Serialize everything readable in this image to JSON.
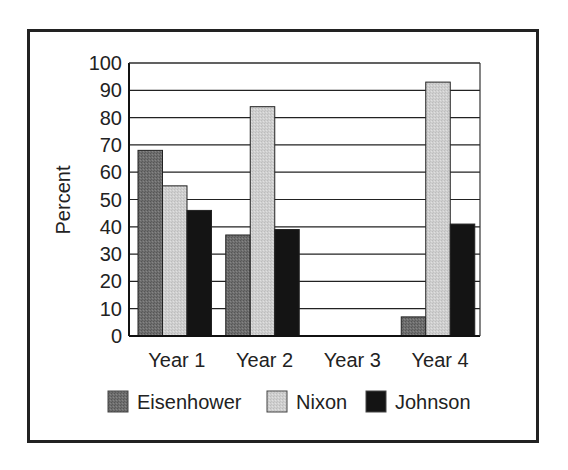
{
  "chart_data": {
    "type": "bar",
    "title": "",
    "xlabel": "",
    "ylabel": "Percent",
    "ylim": [
      0,
      100
    ],
    "yticks": [
      0,
      10,
      20,
      30,
      40,
      50,
      60,
      70,
      80,
      90,
      100
    ],
    "ytick_labels": [
      "0",
      "10",
      "20",
      "30",
      "40",
      "50",
      "60",
      "70",
      "80",
      "90",
      "100"
    ],
    "grid": true,
    "legend_position": "bottom",
    "categories": [
      "Year 1",
      "Year 2",
      "Year 3",
      "Year 4"
    ],
    "series": [
      {
        "name": "Eisenhower",
        "color": "#6e6e6e",
        "values": [
          68,
          37,
          0,
          7
        ]
      },
      {
        "name": "Nixon",
        "color": "#cfcfcf",
        "values": [
          55,
          84,
          0,
          93
        ]
      },
      {
        "name": "Johnson",
        "color": "#141414",
        "values": [
          46,
          39,
          0,
          41
        ]
      }
    ]
  }
}
